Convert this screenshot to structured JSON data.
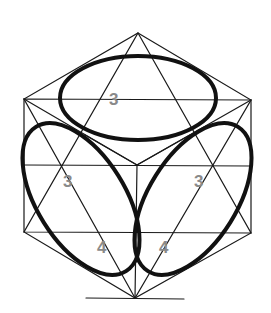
{
  "diagram": {
    "colors": {
      "line": "#1a1a1a",
      "ellipse": "#111111",
      "label": "#8a8a8a",
      "background": "#ffffff"
    },
    "labels": [
      {
        "id": "top-face",
        "text": "3"
      },
      {
        "id": "left-face-upper",
        "text": "3"
      },
      {
        "id": "right-face-upper",
        "text": "3"
      },
      {
        "id": "left-face-lower",
        "text": "4"
      },
      {
        "id": "right-face-lower",
        "text": "4"
      }
    ]
  }
}
